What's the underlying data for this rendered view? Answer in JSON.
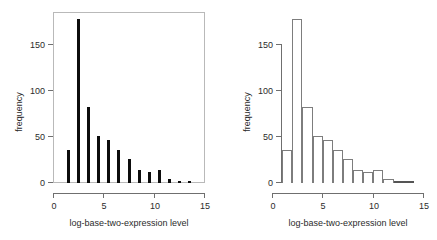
{
  "figure": {
    "title": "",
    "panel_count": 2,
    "background": "#ffffff"
  },
  "chart_data": [
    {
      "type": "bar",
      "panel": "left",
      "title": "",
      "subtitle": "",
      "xlabel": "log-base-two-expression level",
      "ylabel": "frequency",
      "xlim": [
        0,
        15
      ],
      "ylim": [
        0,
        185
      ],
      "xticks": [
        0,
        5,
        10,
        15
      ],
      "yticks": [
        0,
        50,
        100,
        150
      ],
      "xticklabels": [
        "0",
        "5",
        "10",
        "15"
      ],
      "yticklabels": [
        "0",
        "50",
        "100",
        "150"
      ],
      "grid": false,
      "legend": null,
      "frame": "box",
      "bar_style": "thin-spike",
      "bar_color": "#0d0d0d",
      "x": [
        1.5,
        2.5,
        3.5,
        4.5,
        5.5,
        6.5,
        7.5,
        8.5,
        9.5,
        10.5,
        11.5,
        12.5,
        13.5
      ],
      "values": [
        36,
        177,
        82,
        51,
        47,
        36,
        26,
        14,
        12,
        14,
        4,
        2,
        2
      ],
      "categories": [
        "1.5",
        "2.5",
        "3.5",
        "4.5",
        "5.5",
        "6.5",
        "7.5",
        "8.5",
        "9.5",
        "10.5",
        "11.5",
        "12.5",
        "13.5"
      ]
    },
    {
      "type": "bar",
      "panel": "right",
      "title": "",
      "subtitle": "",
      "xlabel": "log-base-two-expression level",
      "ylabel": "frequency",
      "xlim": [
        0,
        15
      ],
      "ylim": [
        0,
        185
      ],
      "xticks": [
        0,
        5,
        10,
        15
      ],
      "yticks": [
        0,
        50,
        100,
        150
      ],
      "xticklabels": [
        "0",
        "5",
        "10",
        "15"
      ],
      "yticklabels": [
        "0",
        "50",
        "100",
        "150"
      ],
      "grid": false,
      "legend": null,
      "frame": "axes-only",
      "bar_style": "histogram-outline",
      "bar_color": "#ffffff",
      "bar_edge_color": "#7d7d7d",
      "bin_edges": [
        1,
        2,
        3,
        4,
        5,
        6,
        7,
        8,
        9,
        10,
        11,
        12,
        13,
        14
      ],
      "values": [
        36,
        177,
        82,
        51,
        47,
        36,
        26,
        14,
        12,
        14,
        4,
        2,
        2
      ],
      "categories": [
        "1-2",
        "2-3",
        "3-4",
        "4-5",
        "5-6",
        "6-7",
        "7-8",
        "8-9",
        "9-10",
        "10-11",
        "11-12",
        "12-13",
        "13-14"
      ]
    }
  ]
}
